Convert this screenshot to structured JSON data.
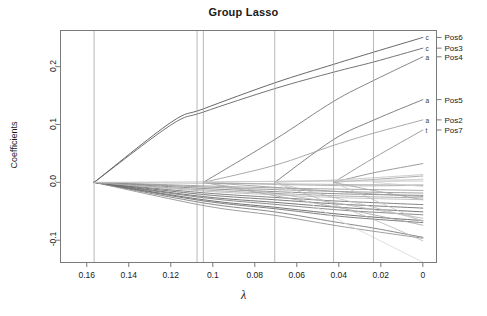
{
  "chart_data": {
    "type": "line",
    "title": "Group Lasso",
    "xlabel": "λ",
    "ylabel": "Coefficients",
    "xticks": [
      "0.16",
      "0.14",
      "0.12",
      "0.1",
      "0.08",
      "0.06",
      "0.04",
      "0.02",
      "0"
    ],
    "xtick_values": [
      0.16,
      0.14,
      0.12,
      0.1,
      0.08,
      0.06,
      0.04,
      0.02,
      0
    ],
    "yticks": [
      "0.2",
      "0.1",
      "0.0",
      "-0.1"
    ],
    "ytick_values": [
      0.2,
      0.1,
      0.0,
      -0.1
    ],
    "xlim": [
      0.1725,
      -0.0065
    ],
    "ylim": [
      -0.1385,
      0.2625
    ],
    "x_axis_reversed": true,
    "grid": false,
    "legend_position": "right-axis",
    "vertical_reference_lines": [
      0.1565,
      0.1075,
      0.1045,
      0.0705,
      0.0425,
      0.0235
    ],
    "curve_end_letters": [
      {
        "letter": "c",
        "value": 0.2505
      },
      {
        "letter": "c",
        "value": 0.232
      },
      {
        "letter": "a",
        "value": 0.217
      },
      {
        "letter": "a",
        "value": 0.143
      },
      {
        "letter": "a",
        "value": 0.108
      },
      {
        "letter": "t",
        "value": 0.0905
      }
    ],
    "right_axis_labels": [
      {
        "label": "Pos6",
        "value": 0.2505
      },
      {
        "label": "Pos3",
        "value": 0.232
      },
      {
        "label": "Pos4",
        "value": 0.217
      },
      {
        "label": "Pos5",
        "value": 0.143
      },
      {
        "label": "Pos2",
        "value": 0.108
      },
      {
        "label": "Pos7",
        "value": 0.0905
      }
    ],
    "series": [
      {
        "name": "Pos6-c",
        "shade": "#4d4d4d",
        "x": [
          0.1565,
          0.12,
          0.1045,
          0.0705,
          0.0425,
          0.0235,
          0
        ],
        "values": [
          0.0,
          0.1035,
          0.127,
          0.172,
          0.204,
          0.225,
          0.2505
        ]
      },
      {
        "name": "Pos3-c",
        "shade": "#5a5a5a",
        "x": [
          0.1565,
          0.12,
          0.1045,
          0.0705,
          0.0425,
          0.0235,
          0
        ],
        "values": [
          0.0,
          0.099,
          0.1215,
          0.162,
          0.1905,
          0.208,
          0.232
        ]
      },
      {
        "name": "Pos4-a",
        "shade": "#707070",
        "x": [
          0.1045,
          0.0705,
          0.0425,
          0.0235,
          0
        ],
        "values": [
          0.0,
          0.074,
          0.14,
          0.176,
          0.217
        ]
      },
      {
        "name": "Pos5-a",
        "shade": "#6a6a6a",
        "x": [
          0.0705,
          0.0425,
          0.0235,
          0
        ],
        "values": [
          0.0,
          0.074,
          0.1075,
          0.143
        ]
      },
      {
        "name": "Pos2-a",
        "shade": "#9a9a9a",
        "x": [
          0.1045,
          0.0705,
          0.0425,
          0.0235,
          0
        ],
        "values": [
          0.0,
          0.0295,
          0.064,
          0.085,
          0.108
        ]
      },
      {
        "name": "Pos7-t",
        "shade": "#8c8c8c",
        "x": [
          0.0425,
          0.0235,
          0
        ],
        "values": [
          0.0,
          0.042,
          0.0905
        ]
      },
      {
        "name": "g1",
        "shade": "#8a8a8a",
        "x": [
          0.0425,
          0.0235,
          0
        ],
        "values": [
          0.0,
          0.0165,
          0.0325
        ]
      },
      {
        "name": "g2",
        "shade": "#9e9e9e",
        "x": [
          0.0425,
          0.0235,
          0
        ],
        "values": [
          0.0,
          0.005,
          0.011
        ]
      },
      {
        "name": "g3",
        "shade": "#b0b0b0",
        "x": [
          0.1565,
          0.1045,
          0.0705,
          0.0425,
          0.0235,
          0
        ],
        "values": [
          0.0,
          -0.0015,
          -0.0025,
          -0.0035,
          -0.004,
          -0.0045
        ]
      },
      {
        "name": "g4",
        "shade": "#a8a8a8",
        "x": [
          0.1045,
          0.0705,
          0.0425,
          0.0235,
          0
        ],
        "values": [
          0.0,
          -0.0035,
          -0.0055,
          -0.006,
          -0.005
        ]
      },
      {
        "name": "g5",
        "shade": "#999999",
        "x": [
          0.1565,
          0.1045,
          0.0705,
          0.0425,
          0.0235,
          0
        ],
        "values": [
          0.0,
          -0.006,
          -0.0095,
          -0.0115,
          -0.0125,
          -0.014
        ]
      },
      {
        "name": "g6",
        "shade": "#8f8f8f",
        "x": [
          0.1565,
          0.1045,
          0.0705,
          0.0425,
          0.0235,
          0
        ],
        "values": [
          0.0,
          -0.008,
          -0.0125,
          -0.0155,
          -0.017,
          -0.0185
        ]
      },
      {
        "name": "g7",
        "shade": "#7d7d7d",
        "x": [
          0.1565,
          0.1045,
          0.0705,
          0.0425,
          0.0235,
          0
        ],
        "values": [
          0.0,
          -0.0105,
          -0.016,
          -0.0195,
          -0.021,
          -0.0225
        ]
      },
      {
        "name": "g8",
        "shade": "#6f6f6f",
        "x": [
          0.1565,
          0.1045,
          0.0705,
          0.0425,
          0.0235,
          0
        ],
        "values": [
          0.0,
          -0.018,
          -0.026,
          -0.032,
          -0.035,
          -0.0385
        ]
      },
      {
        "name": "g9",
        "shade": "#666666",
        "x": [
          0.1565,
          0.1045,
          0.0705,
          0.0425,
          0.0235,
          0
        ],
        "values": [
          0.0,
          -0.021,
          -0.03,
          -0.037,
          -0.0405,
          -0.0445
        ]
      },
      {
        "name": "g10",
        "shade": "#5e5e5e",
        "x": [
          0.1565,
          0.1045,
          0.0705,
          0.0425,
          0.0235,
          0
        ],
        "values": [
          0.0,
          -0.0245,
          -0.0345,
          -0.0425,
          -0.0465,
          -0.051
        ]
      },
      {
        "name": "g11",
        "shade": "#777777",
        "x": [
          0.1565,
          0.1045,
          0.0705,
          0.0425,
          0.0235,
          0
        ],
        "values": [
          0.0,
          -0.0265,
          -0.038,
          -0.047,
          -0.0515,
          -0.056
        ]
      },
      {
        "name": "g12",
        "shade": "#5a5a5a",
        "x": [
          0.1565,
          0.1045,
          0.0705,
          0.0425,
          0.0235,
          0
        ],
        "values": [
          0.0,
          -0.03,
          -0.043,
          -0.054,
          -0.06,
          -0.066
        ]
      },
      {
        "name": "g13",
        "shade": "#686868",
        "x": [
          0.1565,
          0.1045,
          0.0705,
          0.0425,
          0.0235,
          0
        ],
        "values": [
          0.0,
          -0.032,
          -0.0455,
          -0.0575,
          -0.0635,
          -0.0695
        ]
      },
      {
        "name": "g14",
        "shade": "#747474",
        "x": [
          0.1565,
          0.1045,
          0.0705,
          0.0425,
          0.0235,
          0
        ],
        "values": [
          0.0,
          -0.0355,
          -0.051,
          -0.068,
          -0.079,
          -0.095
        ]
      },
      {
        "name": "g15",
        "shade": "#8c8c8c",
        "x": [
          0.1565,
          0.1045,
          0.0705,
          0.0425,
          0.0235,
          0
        ],
        "values": [
          0.0,
          -0.04,
          -0.057,
          -0.074,
          -0.0845,
          -0.0965
        ]
      },
      {
        "name": "g16",
        "shade": "#a5a5a5",
        "x": [
          0.1045,
          0.0705,
          0.0425,
          0.0235,
          0
        ],
        "values": [
          0.0,
          -0.023,
          -0.042,
          -0.056,
          -0.074
        ]
      },
      {
        "name": "g17",
        "shade": "#b5b5b5",
        "x": [
          0.1045,
          0.0705,
          0.0425,
          0.0235,
          0
        ],
        "values": [
          0.0,
          -0.019,
          -0.035,
          -0.047,
          -0.062
        ]
      },
      {
        "name": "g18",
        "shade": "#c0c0c0",
        "x": [
          0.0705,
          0.0425,
          0.0235,
          0
        ],
        "values": [
          0.0,
          -0.026,
          -0.043,
          -0.066
        ]
      },
      {
        "name": "g19",
        "shade": "#bbbbbb",
        "x": [
          0.0705,
          0.0425,
          0.0235,
          0
        ],
        "values": [
          0.0,
          -0.038,
          -0.064,
          -0.101
        ]
      },
      {
        "name": "g20",
        "shade": "#c8c8c8",
        "x": [
          0.0425,
          0.0235,
          0
        ],
        "values": [
          0.0,
          -0.03,
          -0.068
        ]
      },
      {
        "name": "g21",
        "shade": "#aaaaaa",
        "x": [
          0.0425,
          0.0235,
          0
        ],
        "values": [
          0.0,
          -0.014,
          -0.03
        ]
      },
      {
        "name": "g22",
        "shade": "#b8b8b8",
        "x": [
          0.1565,
          0.1045,
          0.0705,
          0.0425,
          0.0235,
          0
        ],
        "values": [
          0.0,
          -0.015,
          -0.0215,
          -0.026,
          -0.028,
          -0.03
        ]
      },
      {
        "name": "g23",
        "shade": "#a0a0a0",
        "x": [
          0.1565,
          0.1045,
          0.0705,
          0.0425,
          0.0235,
          0
        ],
        "values": [
          0.0,
          -0.013,
          -0.019,
          -0.023,
          -0.025,
          -0.027
        ]
      },
      {
        "name": "g24",
        "shade": "#9c9c9c",
        "x": [
          0.1045,
          0.0705,
          0.0425,
          0.0235,
          0
        ],
        "values": [
          0.0,
          -0.0085,
          -0.0155,
          -0.02,
          -0.0245
        ]
      },
      {
        "name": "g25",
        "shade": "#d0d0d0",
        "x": [
          0.0235,
          0
        ],
        "values": [
          0.0,
          -0.007
        ]
      },
      {
        "name": "g26",
        "shade": "#d8d8d8",
        "x": [
          0.0235,
          0
        ],
        "values": [
          0.0,
          0.006
        ]
      },
      {
        "name": "g27",
        "shade": "#c4c4c4",
        "x": [
          0.0705,
          0.0425,
          0.0235,
          0
        ],
        "values": [
          0.0,
          0.004,
          0.008,
          0.0135
        ]
      },
      {
        "name": "g28",
        "shade": "#cccccc",
        "x": [
          0.1045,
          0.0705,
          0.0425,
          0.0235,
          0
        ],
        "values": [
          0.0,
          0.002,
          0.0035,
          0.004,
          0.0045
        ]
      },
      {
        "name": "g29",
        "shade": "#c9c9c9",
        "x": [
          0.1565,
          0.1045,
          0.0705,
          0.0425,
          0.0235,
          0
        ],
        "values": [
          0.0,
          0.001,
          0.0015,
          0.0018,
          0.002,
          0.0022
        ]
      },
      {
        "name": "g30",
        "shade": "#dadada",
        "x": [
          0.0705,
          0.0425,
          0.0235,
          0
        ],
        "values": [
          0.0,
          -0.06,
          -0.095,
          -0.138
        ]
      }
    ]
  },
  "axis": {
    "title": "Group Lasso",
    "xlabel": "λ",
    "ylabel": "Coefficients"
  }
}
